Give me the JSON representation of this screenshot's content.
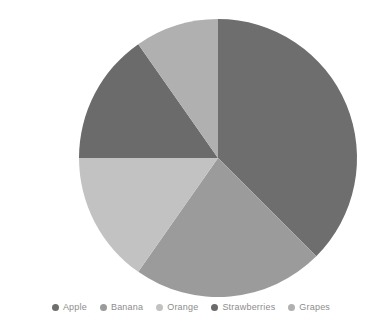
{
  "chart_data": {
    "type": "pie",
    "title": "",
    "categories": [
      "Apple",
      "Banana",
      "Orange",
      "Strawberries",
      "Grapes"
    ],
    "values": [
      37.5,
      22.2,
      15.3,
      15.3,
      9.7
    ],
    "units": "percent",
    "start_angle_deg": 0,
    "direction": "clockwise",
    "slice_angles_deg": [
      135,
      80,
      55,
      55,
      35
    ],
    "slice_boundaries_deg": [
      0,
      135,
      215,
      270,
      325,
      360
    ],
    "colors": [
      "#6e6e6e",
      "#9b9b9b",
      "#c2c2c2",
      "#6b6b6b",
      "#b0b0b0"
    ],
    "legend": {
      "position": "bottom",
      "entries": [
        {
          "label": "Apple",
          "color": "#6e6e6e"
        },
        {
          "label": "Banana",
          "color": "#9b9b9b"
        },
        {
          "label": "Orange",
          "color": "#c2c2c2"
        },
        {
          "label": "Strawberries",
          "color": "#6b6b6b"
        },
        {
          "label": "Grapes",
          "color": "#b0b0b0"
        }
      ]
    },
    "grid": false,
    "xlabel": "",
    "ylabel": "",
    "background": "#ffffff",
    "geometry": {
      "cx": 218,
      "cy": 158,
      "r": 139
    }
  }
}
